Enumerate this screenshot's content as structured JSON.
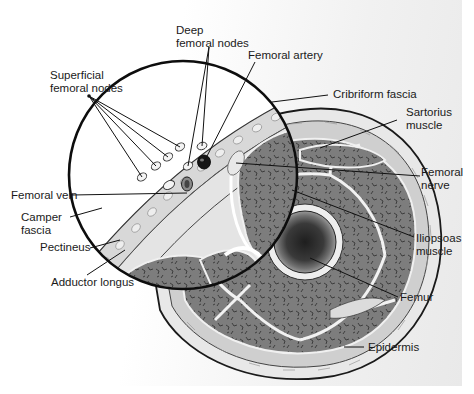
{
  "figure": {
    "type": "anatomical cross-section",
    "colors": {
      "outline": "#111111",
      "muscle": "#7a7a7a",
      "fat": "#e6e6e6",
      "background": "#ffffff"
    }
  },
  "labels": {
    "deep_femoral_nodes": "Deep\nfemoral nodes",
    "deep_line1": "Deep",
    "deep_line2": "femoral nodes",
    "femoral_artery": "Femoral artery",
    "superficial_line1": "Superficial",
    "superficial_line2": "femoral nodes",
    "cribriform_fascia": "Cribriform fascia",
    "sartorius_line1": "Sartorius",
    "sartorius_line2": "muscle",
    "femoral_vein": "Femoral vein",
    "femoral_nerve_line1": "Femoral",
    "femoral_nerve_line2": "nerve",
    "camper_line1": "Camper",
    "camper_line2": "fascia",
    "pectineus": "Pectineus",
    "iliopsoas_line1": "Iliopsoas",
    "iliopsoas_line2": "muscle",
    "adductor_longus": "Adductor longus",
    "femur": "Femur",
    "epidermis": "Epidermis"
  }
}
